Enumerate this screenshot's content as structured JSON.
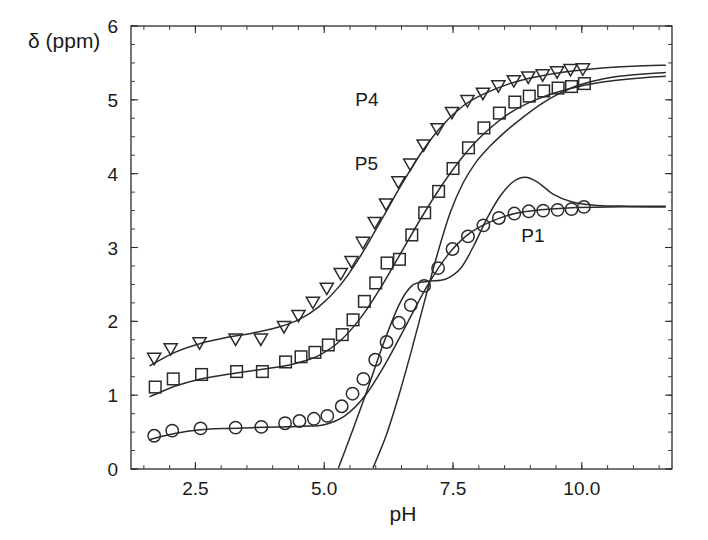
{
  "chart_data": {
    "type": "scatter",
    "title": "",
    "xlabel": "pH",
    "ylabel": "δ (ppm)",
    "xlim": [
      1.25,
      11.75
    ],
    "ylim": [
      0,
      6
    ],
    "xticks": [
      2.5,
      5.0,
      7.5,
      10.0
    ],
    "xtick_labels": [
      "2.5",
      "5.0",
      "7.5",
      "10.0"
    ],
    "yticks": [
      0,
      1,
      2,
      3,
      4,
      5,
      6
    ],
    "ytick_labels": [
      "0",
      "1",
      "2",
      "3",
      "4",
      "5",
      "6"
    ],
    "xtick_minor_step": 0.5,
    "ytick_minor_step": 0.25,
    "grid": false,
    "legend": "inline-annotations",
    "annotations": [
      {
        "text": "P4",
        "x": 5.83,
        "y": 4.92
      },
      {
        "text": "P5",
        "x": 5.82,
        "y": 4.05
      },
      {
        "text": "P1",
        "x": 9.05,
        "y": 3.07
      }
    ],
    "series": [
      {
        "name": "P4",
        "marker": "triangle-down-open",
        "label": "P4",
        "points": [
          {
            "x": 1.7,
            "y": 1.49
          },
          {
            "x": 2.02,
            "y": 1.62
          },
          {
            "x": 2.58,
            "y": 1.7
          },
          {
            "x": 3.28,
            "y": 1.75
          },
          {
            "x": 3.77,
            "y": 1.75
          },
          {
            "x": 4.22,
            "y": 1.92
          },
          {
            "x": 4.5,
            "y": 2.07
          },
          {
            "x": 4.78,
            "y": 2.25
          },
          {
            "x": 5.05,
            "y": 2.44
          },
          {
            "x": 5.32,
            "y": 2.64
          },
          {
            "x": 5.53,
            "y": 2.8
          },
          {
            "x": 5.75,
            "y": 3.06
          },
          {
            "x": 5.98,
            "y": 3.33
          },
          {
            "x": 6.2,
            "y": 3.58
          },
          {
            "x": 6.44,
            "y": 3.88
          },
          {
            "x": 6.67,
            "y": 4.12
          },
          {
            "x": 6.93,
            "y": 4.38
          },
          {
            "x": 7.2,
            "y": 4.6
          },
          {
            "x": 7.48,
            "y": 4.82
          },
          {
            "x": 7.78,
            "y": 4.98
          },
          {
            "x": 8.08,
            "y": 5.08
          },
          {
            "x": 8.38,
            "y": 5.18
          },
          {
            "x": 8.68,
            "y": 5.25
          },
          {
            "x": 8.96,
            "y": 5.3
          },
          {
            "x": 9.24,
            "y": 5.33
          },
          {
            "x": 9.52,
            "y": 5.37
          },
          {
            "x": 9.78,
            "y": 5.4
          },
          {
            "x": 10.02,
            "y": 5.41
          }
        ]
      },
      {
        "name": "P5",
        "marker": "square-open",
        "label": "P5",
        "points": [
          {
            "x": 1.72,
            "y": 1.11
          },
          {
            "x": 2.07,
            "y": 1.22
          },
          {
            "x": 2.62,
            "y": 1.28
          },
          {
            "x": 3.3,
            "y": 1.32
          },
          {
            "x": 3.8,
            "y": 1.32
          },
          {
            "x": 4.25,
            "y": 1.45
          },
          {
            "x": 4.55,
            "y": 1.52
          },
          {
            "x": 4.82,
            "y": 1.58
          },
          {
            "x": 5.08,
            "y": 1.68
          },
          {
            "x": 5.35,
            "y": 1.82
          },
          {
            "x": 5.56,
            "y": 2.02
          },
          {
            "x": 5.78,
            "y": 2.27
          },
          {
            "x": 6.0,
            "y": 2.52
          },
          {
            "x": 6.22,
            "y": 2.79
          },
          {
            "x": 6.46,
            "y": 2.84
          },
          {
            "x": 6.7,
            "y": 3.17
          },
          {
            "x": 6.95,
            "y": 3.47
          },
          {
            "x": 7.22,
            "y": 3.76
          },
          {
            "x": 7.5,
            "y": 4.07
          },
          {
            "x": 7.8,
            "y": 4.35
          },
          {
            "x": 8.1,
            "y": 4.62
          },
          {
            "x": 8.4,
            "y": 4.82
          },
          {
            "x": 8.7,
            "y": 4.97
          },
          {
            "x": 8.98,
            "y": 5.05
          },
          {
            "x": 9.26,
            "y": 5.12
          },
          {
            "x": 9.54,
            "y": 5.16
          },
          {
            "x": 9.8,
            "y": 5.18
          },
          {
            "x": 10.05,
            "y": 5.22
          }
        ]
      },
      {
        "name": "P1",
        "marker": "circle-open",
        "label": "P1",
        "points": [
          {
            "x": 1.7,
            "y": 0.45
          },
          {
            "x": 2.05,
            "y": 0.52
          },
          {
            "x": 2.6,
            "y": 0.55
          },
          {
            "x": 3.28,
            "y": 0.56
          },
          {
            "x": 3.78,
            "y": 0.57
          },
          {
            "x": 4.24,
            "y": 0.62
          },
          {
            "x": 4.52,
            "y": 0.65
          },
          {
            "x": 4.8,
            "y": 0.68
          },
          {
            "x": 5.06,
            "y": 0.72
          },
          {
            "x": 5.34,
            "y": 0.85
          },
          {
            "x": 5.55,
            "y": 1.02
          },
          {
            "x": 5.76,
            "y": 1.22
          },
          {
            "x": 5.99,
            "y": 1.48
          },
          {
            "x": 6.21,
            "y": 1.72
          },
          {
            "x": 6.45,
            "y": 1.98
          },
          {
            "x": 6.68,
            "y": 2.22
          },
          {
            "x": 6.94,
            "y": 2.48
          },
          {
            "x": 7.21,
            "y": 2.72
          },
          {
            "x": 7.49,
            "y": 2.98
          },
          {
            "x": 7.79,
            "y": 3.15
          },
          {
            "x": 8.09,
            "y": 3.3
          },
          {
            "x": 8.39,
            "y": 3.4
          },
          {
            "x": 8.69,
            "y": 3.46
          },
          {
            "x": 8.97,
            "y": 3.49
          },
          {
            "x": 9.25,
            "y": 3.5
          },
          {
            "x": 9.53,
            "y": 3.51
          },
          {
            "x": 9.8,
            "y": 3.52
          },
          {
            "x": 10.04,
            "y": 3.55
          }
        ]
      }
    ],
    "fit_curves": [
      {
        "name": "P4-fit",
        "points": [
          {
            "x": 1.62,
            "y": 1.4
          },
          {
            "x": 2.1,
            "y": 1.58
          },
          {
            "x": 2.6,
            "y": 1.7
          },
          {
            "x": 3.1,
            "y": 1.78
          },
          {
            "x": 3.6,
            "y": 1.84
          },
          {
            "x": 4.1,
            "y": 1.92
          },
          {
            "x": 4.5,
            "y": 2.02
          },
          {
            "x": 4.9,
            "y": 2.2
          },
          {
            "x": 5.3,
            "y": 2.48
          },
          {
            "x": 5.7,
            "y": 2.88
          },
          {
            "x": 6.1,
            "y": 3.36
          },
          {
            "x": 6.5,
            "y": 3.85
          },
          {
            "x": 6.9,
            "y": 4.3
          },
          {
            "x": 7.3,
            "y": 4.66
          },
          {
            "x": 7.7,
            "y": 4.92
          },
          {
            "x": 8.1,
            "y": 5.08
          },
          {
            "x": 8.6,
            "y": 5.22
          },
          {
            "x": 9.1,
            "y": 5.31
          },
          {
            "x": 9.7,
            "y": 5.38
          },
          {
            "x": 10.4,
            "y": 5.43
          },
          {
            "x": 11.2,
            "y": 5.46
          },
          {
            "x": 11.62,
            "y": 5.47
          }
        ]
      },
      {
        "name": "P5-fit",
        "points": [
          {
            "x": 1.62,
            "y": 0.98
          },
          {
            "x": 2.1,
            "y": 1.12
          },
          {
            "x": 2.6,
            "y": 1.22
          },
          {
            "x": 3.1,
            "y": 1.28
          },
          {
            "x": 3.6,
            "y": 1.33
          },
          {
            "x": 4.1,
            "y": 1.38
          },
          {
            "x": 4.5,
            "y": 1.44
          },
          {
            "x": 4.9,
            "y": 1.54
          },
          {
            "x": 5.3,
            "y": 1.73
          },
          {
            "x": 5.7,
            "y": 2.04
          },
          {
            "x": 6.1,
            "y": 2.46
          },
          {
            "x": 6.5,
            "y": 2.94
          },
          {
            "x": 6.9,
            "y": 3.42
          },
          {
            "x": 7.3,
            "y": 3.86
          },
          {
            "x": 7.7,
            "y": 4.24
          },
          {
            "x": 8.1,
            "y": 4.54
          },
          {
            "x": 8.6,
            "y": 4.82
          },
          {
            "x": 9.1,
            "y": 5.0
          },
          {
            "x": 9.7,
            "y": 5.14
          },
          {
            "x": 10.4,
            "y": 5.24
          },
          {
            "x": 11.2,
            "y": 5.3
          },
          {
            "x": 11.62,
            "y": 5.32
          }
        ]
      },
      {
        "name": "P1-fit",
        "points": [
          {
            "x": 1.62,
            "y": 0.4
          },
          {
            "x": 2.1,
            "y": 0.48
          },
          {
            "x": 2.6,
            "y": 0.53
          },
          {
            "x": 3.1,
            "y": 0.55
          },
          {
            "x": 3.6,
            "y": 0.56
          },
          {
            "x": 4.1,
            "y": 0.57
          },
          {
            "x": 4.6,
            "y": 0.58
          },
          {
            "x": 5.0,
            "y": 0.6
          },
          {
            "x": 5.4,
            "y": 0.72
          },
          {
            "x": 5.8,
            "y": 1.0
          },
          {
            "x": 6.2,
            "y": 1.44
          },
          {
            "x": 6.6,
            "y": 1.96
          },
          {
            "x": 7.0,
            "y": 2.48
          },
          {
            "x": 7.4,
            "y": 2.9
          },
          {
            "x": 7.8,
            "y": 3.18
          },
          {
            "x": 8.2,
            "y": 3.34
          },
          {
            "x": 8.7,
            "y": 3.46
          },
          {
            "x": 9.2,
            "y": 3.51
          },
          {
            "x": 9.8,
            "y": 3.54
          },
          {
            "x": 10.5,
            "y": 3.55
          },
          {
            "x": 11.3,
            "y": 3.55
          },
          {
            "x": 11.62,
            "y": 3.55
          }
        ]
      },
      {
        "name": "extra-fit-a",
        "points": [
          {
            "x": 5.95,
            "y": 0.02
          },
          {
            "x": 6.2,
            "y": 0.45
          },
          {
            "x": 6.45,
            "y": 1.0
          },
          {
            "x": 6.7,
            "y": 1.62
          },
          {
            "x": 6.95,
            "y": 2.28
          },
          {
            "x": 7.2,
            "y": 2.92
          },
          {
            "x": 7.45,
            "y": 3.48
          },
          {
            "x": 7.7,
            "y": 3.88
          },
          {
            "x": 7.95,
            "y": 4.16
          },
          {
            "x": 8.2,
            "y": 4.36
          },
          {
            "x": 8.5,
            "y": 4.56
          },
          {
            "x": 8.85,
            "y": 4.76
          },
          {
            "x": 9.2,
            "y": 4.94
          },
          {
            "x": 9.55,
            "y": 5.08
          },
          {
            "x": 9.95,
            "y": 5.2
          },
          {
            "x": 10.45,
            "y": 5.29
          },
          {
            "x": 11.0,
            "y": 5.34
          },
          {
            "x": 11.62,
            "y": 5.37
          }
        ]
      },
      {
        "name": "extra-fit-b",
        "points": [
          {
            "x": 5.28,
            "y": 0.02
          },
          {
            "x": 5.55,
            "y": 0.52
          },
          {
            "x": 5.85,
            "y": 1.1
          },
          {
            "x": 6.15,
            "y": 1.7
          },
          {
            "x": 6.45,
            "y": 2.22
          },
          {
            "x": 6.7,
            "y": 2.48
          },
          {
            "x": 7.0,
            "y": 2.54
          },
          {
            "x": 7.35,
            "y": 2.57
          },
          {
            "x": 7.65,
            "y": 2.72
          },
          {
            "x": 7.9,
            "y": 3.02
          },
          {
            "x": 8.15,
            "y": 3.38
          },
          {
            "x": 8.4,
            "y": 3.68
          },
          {
            "x": 8.65,
            "y": 3.88
          },
          {
            "x": 8.9,
            "y": 3.95
          },
          {
            "x": 9.15,
            "y": 3.88
          },
          {
            "x": 9.45,
            "y": 3.72
          },
          {
            "x": 9.8,
            "y": 3.62
          },
          {
            "x": 10.3,
            "y": 3.57
          },
          {
            "x": 10.9,
            "y": 3.56
          },
          {
            "x": 11.62,
            "y": 3.56
          }
        ]
      }
    ]
  }
}
